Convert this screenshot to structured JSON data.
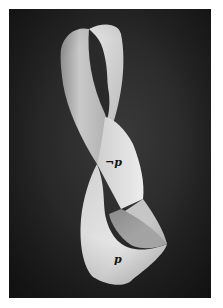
{
  "image": {
    "subject": "Möbius strip photograph",
    "background_color": "#262626",
    "strip_color": "#d8d8d8",
    "border_color": "#ffffff"
  },
  "labels": {
    "upper": "¬p",
    "lower": "p"
  }
}
